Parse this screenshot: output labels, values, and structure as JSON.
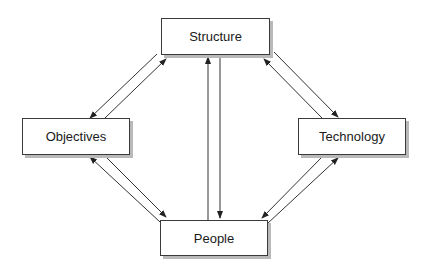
{
  "diagram": {
    "type": "bidirectional relationship diagram",
    "nodes": [
      {
        "id": "structure",
        "label": "Structure",
        "x": 161,
        "y": 18,
        "w": 109,
        "h": 37
      },
      {
        "id": "objectives",
        "label": "Objectives",
        "x": 22,
        "y": 118,
        "w": 108,
        "h": 37
      },
      {
        "id": "technology",
        "label": "Technology",
        "x": 298,
        "y": 118,
        "w": 108,
        "h": 37
      },
      {
        "id": "people",
        "label": "People",
        "x": 160,
        "y": 220,
        "w": 108,
        "h": 36
      }
    ],
    "edges": [
      {
        "from": "structure",
        "to": "objectives",
        "direction": "one-way"
      },
      {
        "from": "objectives",
        "to": "structure",
        "direction": "one-way"
      },
      {
        "from": "structure",
        "to": "technology",
        "direction": "one-way"
      },
      {
        "from": "technology",
        "to": "structure",
        "direction": "one-way"
      },
      {
        "from": "objectives",
        "to": "people",
        "direction": "one-way"
      },
      {
        "from": "people",
        "to": "objectives",
        "direction": "one-way"
      },
      {
        "from": "technology",
        "to": "people",
        "direction": "one-way"
      },
      {
        "from": "people",
        "to": "technology",
        "direction": "one-way"
      },
      {
        "from": "people",
        "to": "structure",
        "direction": "one-way"
      },
      {
        "from": "structure",
        "to": "people",
        "direction": "one-way"
      }
    ],
    "colors": {
      "line": "#333333",
      "shadow": "#b9b9b9",
      "background": "#ffffff"
    }
  }
}
